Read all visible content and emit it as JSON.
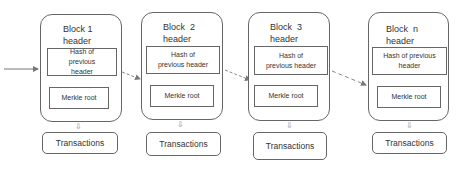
{
  "diagram": {
    "blocks": [
      {
        "title_line1": "Block 1",
        "title_line2": "header",
        "hash": "Hash of previous header",
        "merkle": "Merkle root",
        "transactions": "Transactions"
      },
      {
        "title_line1": "Block  2",
        "title_line2": "header",
        "hash": "Hash of previous header",
        "merkle": "Merkle root",
        "transactions": "Transactions"
      },
      {
        "title_line1": "Block  3",
        "title_line2": "header",
        "hash": "Hash of previous header",
        "merkle": "Merkle root",
        "transactions": "Transactions"
      },
      {
        "title_line1": "Block  n",
        "title_line2": "header",
        "hash": "Hash of previous header",
        "merkle": "Merkle root",
        "transactions": "Transactions"
      }
    ],
    "arrows": [
      {
        "from": "external",
        "to": "Block 1",
        "style": "solid"
      },
      {
        "from": "Block 1",
        "to": "Block 2",
        "style": "dashed"
      },
      {
        "from": "Block 2",
        "to": "Block 3",
        "style": "dashed"
      },
      {
        "from": "Block 3",
        "to": "Block n",
        "style": "dashed"
      }
    ],
    "colors": {
      "border": "#666666",
      "arrow": "#888888",
      "text": "#333333"
    }
  }
}
